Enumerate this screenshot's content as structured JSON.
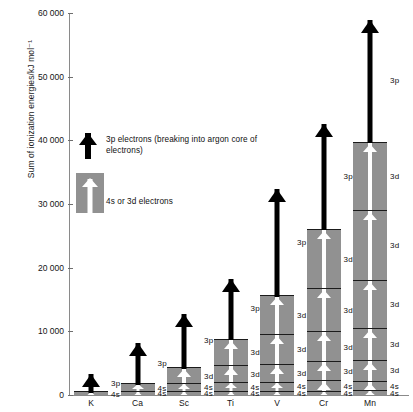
{
  "chart_data": {
    "type": "bar",
    "title": "",
    "xlabel": "",
    "ylabel": "Sum of ionization energies/kJ mol⁻¹",
    "ylim": [
      0,
      60000
    ],
    "yticks": [
      0,
      10000,
      20000,
      30000,
      40000,
      50000,
      60000
    ],
    "ytick_labels": [
      "0",
      "10 000",
      "20 000",
      "30 000",
      "40 000",
      "50 000",
      "60 000"
    ],
    "grid": false,
    "legend_position": "upper-left-inside",
    "categories": [
      "K",
      "Ca",
      "Sc",
      "Ti",
      "V",
      "Cr",
      "Mn"
    ],
    "values": [
      420,
      1735,
      4260,
      8800,
      15600,
      26000,
      39800
    ],
    "note": "Stacked bar: each grey segment is one successive ionization (4s or 3d electron); the black arrow above each bar denotes the next ionization which breaks into the argon 3p core and runs off scale.",
    "series": [
      {
        "name": "K",
        "total": 420,
        "segments": [
          {
            "label": "4s",
            "orbital": "4s",
            "value": 420,
            "cumulative": 420
          }
        ],
        "arrow": {
          "label": "3p",
          "orbital": "3p",
          "from": 420,
          "to": 3500
        }
      },
      {
        "name": "Ca",
        "total": 1735,
        "segments": [
          {
            "label": "4s",
            "orbital": "4s",
            "value": 590,
            "cumulative": 590
          },
          {
            "label": "4s",
            "orbital": "4s",
            "value": 1145,
            "cumulative": 1735
          }
        ],
        "arrow": {
          "label": "3p",
          "orbital": "3p",
          "from": 1735,
          "to": 8300
        }
      },
      {
        "name": "Sc",
        "total": 4260,
        "segments": [
          {
            "label": "4s",
            "orbital": "4s",
            "value": 630,
            "cumulative": 630
          },
          {
            "label": "4s",
            "orbital": "4s",
            "value": 1235,
            "cumulative": 1865
          },
          {
            "label": "3d",
            "orbital": "3d",
            "value": 2395,
            "cumulative": 4260
          }
        ],
        "arrow": {
          "label": "3p",
          "orbital": "3p",
          "from": 4260,
          "to": 12900
        }
      },
      {
        "name": "Ti",
        "total": 8800,
        "segments": [
          {
            "label": "4s",
            "orbital": "4s",
            "value": 660,
            "cumulative": 660
          },
          {
            "label": "4s",
            "orbital": "4s",
            "value": 1310,
            "cumulative": 1970
          },
          {
            "label": "3d",
            "orbital": "3d",
            "value": 2650,
            "cumulative": 4620
          },
          {
            "label": "3d",
            "orbital": "3d",
            "value": 4180,
            "cumulative": 8800
          }
        ],
        "arrow": {
          "label": "3p",
          "orbital": "3p",
          "from": 8800,
          "to": 18400
        }
      },
      {
        "name": "V",
        "total": 15600,
        "segments": [
          {
            "label": "4s",
            "orbital": "4s",
            "value": 650,
            "cumulative": 650
          },
          {
            "label": "4s",
            "orbital": "4s",
            "value": 1410,
            "cumulative": 2060
          },
          {
            "label": "3d",
            "orbital": "3d",
            "value": 2830,
            "cumulative": 4890
          },
          {
            "label": "3d",
            "orbital": "3d",
            "value": 4620,
            "cumulative": 9510
          },
          {
            "label": "3d",
            "orbital": "3d",
            "value": 6090,
            "cumulative": 15600
          }
        ],
        "arrow": {
          "label": "3p",
          "orbital": "3p",
          "from": 15600,
          "to": 32500
        }
      },
      {
        "name": "Cr",
        "total": 26000,
        "segments": [
          {
            "label": "4s",
            "orbital": "4s",
            "value": 650,
            "cumulative": 650
          },
          {
            "label": "4s",
            "orbital": "4s",
            "value": 1590,
            "cumulative": 2240
          },
          {
            "label": "3d",
            "orbital": "3d",
            "value": 2990,
            "cumulative": 5230
          },
          {
            "label": "3d",
            "orbital": "3d",
            "value": 4770,
            "cumulative": 10000
          },
          {
            "label": "3d",
            "orbital": "3d",
            "value": 6690,
            "cumulative": 16690
          },
          {
            "label": "3d",
            "orbital": "3d",
            "value": 9310,
            "cumulative": 26000
          }
        ],
        "arrow": {
          "label": "3p",
          "orbital": "3p",
          "from": 26000,
          "to": 42800
        }
      },
      {
        "name": "Mn",
        "total": 39800,
        "segments": [
          {
            "label": "4s",
            "orbital": "4s",
            "value": 720,
            "cumulative": 720
          },
          {
            "label": "4s",
            "orbital": "4s",
            "value": 1510,
            "cumulative": 2230
          },
          {
            "label": "3d",
            "orbital": "3d",
            "value": 3250,
            "cumulative": 5480
          },
          {
            "label": "3d",
            "orbital": "3d",
            "value": 5070,
            "cumulative": 10550
          },
          {
            "label": "3d",
            "orbital": "3d",
            "value": 7450,
            "cumulative": 18000
          },
          {
            "label": "3d",
            "orbital": "3d",
            "value": 11000,
            "cumulative": 29000
          },
          {
            "label": "3d",
            "orbital": "3d",
            "value": 10800,
            "cumulative": 39800
          }
        ],
        "arrow": {
          "label": "3p",
          "orbital": "3p",
          "from": 39800,
          "to": 59000
        }
      }
    ]
  },
  "legend": {
    "items": [
      {
        "key": "black-arrow",
        "label": "3p electrons (breaking into argon core of electrons)"
      },
      {
        "key": "grey-bar-white-arrow",
        "label": "4s or 3d electrons"
      }
    ]
  },
  "colors": {
    "bar_fill": "#919191",
    "segment_divider": "#1b1b1b",
    "arrow_black": "#000000",
    "arrow_white": "#ffffff",
    "axis": "#8a8a8a",
    "text": "#111111",
    "background": "#ffffff"
  }
}
